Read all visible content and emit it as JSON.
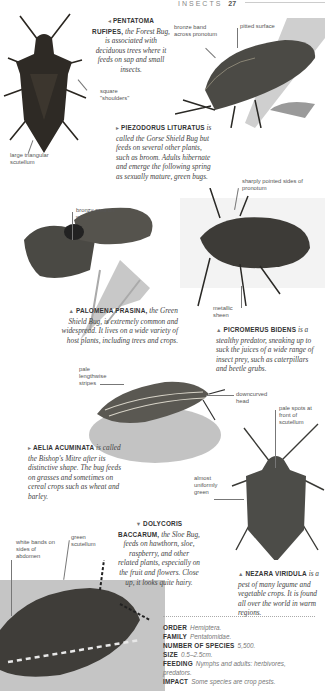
{
  "header": {
    "section": "Insects",
    "page": "27"
  },
  "entries": [
    {
      "id": "pentatoma",
      "arrow": "◂",
      "species": "PENTATOMA RUFIPES,",
      "text": "the Forest Bug, is associated with deciduous trees where it feeds on sap and small insects."
    },
    {
      "id": "piezodorus",
      "arrow": "▸",
      "species": "PIEZODORUS LITURATUS",
      "text": "is called the Gorse Shield Bug but feeds on several other plants, such as broom. Adults hibernate and emerge the following spring as sexually mature, green bugs."
    },
    {
      "id": "palomena",
      "arrow": "▲",
      "species": "PALOMENA PRASINA,",
      "text": "the Green Shield Bug, is extremely common and widespread. It lives on a wide variety of host plants, including trees and crops."
    },
    {
      "id": "picromerus",
      "arrow": "▲",
      "species": "PICROMERUS BIDENS",
      "text": "is a stealthy predator, sneaking up to suck the juices of a wide range of insect prey, such as caterpillars and beetle grubs."
    },
    {
      "id": "aelia",
      "arrow": "▸",
      "species": "AELIA ACUMINATA",
      "text": "is called the Bishop's Mitre after its distinctive shape. The bug feeds on grasses and sometimes on cereal crops such as wheat and barley."
    },
    {
      "id": "dolycoris",
      "arrow": "▼",
      "species": "DOLYCORIS BACCARUM,",
      "text": "the Sloe Bug, feeds on hawthorn, sloe, raspberry, and other related plants, especially on the fruit and flowers. Close up, it looks quite hairy."
    },
    {
      "id": "nezara",
      "arrow": "▲",
      "species": "NEZARA VIRIDULA",
      "text": "is a pest of many legume and vegetable crops. It is found all over the world in warm regions."
    }
  ],
  "labels": {
    "square_shoulders": "square \"shoulders\"",
    "large_scutellum": "large triangular scutellum",
    "bronze_band": "bronze band across pronotum",
    "pitted_surface": "pitted surface",
    "bronzy_area": "bronzy area on wings",
    "sharply_pointed": "sharply pointed sides of pronotum",
    "metallic_sheen": "metallic sheen",
    "pale_stripes": "pale lengthwise stripes",
    "downcurved_head": "downcurved head",
    "pale_spots": "pale spots at front of scutellum",
    "uniformly_green": "almost uniformly green",
    "white_bands": "white bands on sides of abdomen",
    "green_scutellum": "green scutellum"
  },
  "facts": [
    {
      "key": "ORDER",
      "value": "Hemiptera."
    },
    {
      "key": "FAMILY",
      "value": "Pentatomidae."
    },
    {
      "key": "NUMBER OF SPECIES",
      "value": "5,500."
    },
    {
      "key": "SIZE",
      "value": "0.5–2.5cm."
    },
    {
      "key": "FEEDING",
      "value": "Nymphs and adults: herbivores, predators."
    },
    {
      "key": "IMPACT",
      "value": "Some species are crop pests."
    }
  ]
}
